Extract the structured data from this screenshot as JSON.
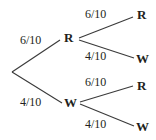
{
  "diagram": {
    "type": "probability-tree",
    "title": "",
    "colors": {
      "line": "#3a3a3a",
      "text": "#231f20",
      "background": "#ffffff"
    },
    "root": {
      "label": "",
      "x": 12,
      "y": 72
    },
    "nodes": [
      {
        "id": "level1-R",
        "label": "R",
        "x": 68,
        "y": 38,
        "level": 1
      },
      {
        "id": "level1-W",
        "label": "W",
        "x": 70,
        "y": 103,
        "level": 1
      },
      {
        "id": "leaf-RR",
        "label": "R",
        "x": 141,
        "y": 15,
        "level": 2
      },
      {
        "id": "leaf-RW",
        "label": "W",
        "x": 142,
        "y": 59,
        "level": 2
      },
      {
        "id": "leaf-WR",
        "label": "R",
        "x": 141,
        "y": 86,
        "level": 2
      },
      {
        "id": "leaf-WW",
        "label": "W",
        "x": 142,
        "y": 127,
        "level": 2
      }
    ],
    "edges": [
      {
        "id": "root-to-R",
        "from": "root",
        "to": "level1-R",
        "label": "6/10",
        "x1": 12,
        "y1": 72,
        "x2": 60,
        "y2": 40,
        "label_x": 20,
        "label_y": 34
      },
      {
        "id": "root-to-W",
        "from": "root",
        "to": "level1-W",
        "label": "4/10",
        "x1": 12,
        "y1": 72,
        "x2": 62,
        "y2": 103,
        "label_x": 20,
        "label_y": 96
      },
      {
        "id": "R-to-R",
        "from": "level1-R",
        "to": "leaf-RR",
        "label": "6/10",
        "x1": 79,
        "y1": 38,
        "x2": 133,
        "y2": 17,
        "label_x": 85,
        "label_y": 8
      },
      {
        "id": "R-to-W",
        "from": "level1-R",
        "to": "leaf-RW",
        "label": "4/10",
        "x1": 79,
        "y1": 40,
        "x2": 134,
        "y2": 58,
        "label_x": 85,
        "label_y": 50
      },
      {
        "id": "W-to-R",
        "from": "level1-W",
        "to": "leaf-WR",
        "label": "6/10",
        "x1": 80,
        "y1": 102,
        "x2": 133,
        "y2": 86,
        "label_x": 85,
        "label_y": 76
      },
      {
        "id": "W-to-W",
        "from": "level1-W",
        "to": "leaf-WW",
        "label": "4/10",
        "x1": 80,
        "y1": 104,
        "x2": 134,
        "y2": 126,
        "label_x": 85,
        "label_y": 118
      }
    ]
  }
}
